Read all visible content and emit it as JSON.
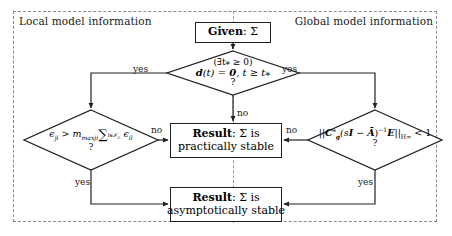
{
  "figure": {
    "type": "flowchart"
  },
  "regions": {
    "left_label": "Local model information",
    "right_label": "Global model information"
  },
  "nodes": {
    "given": {
      "kind": "terminal-box",
      "label_bold": "Given",
      "label_rest": ": Σ"
    },
    "decision_top": {
      "kind": "decision-diamond",
      "line1": "(∃t⁎ ≥ 0)",
      "line2_a": "d",
      "line2_b": "(t) = ",
      "line2_c": "0",
      "line2_d": ",   t ≥ t⁎",
      "question": "?"
    },
    "decision_left": {
      "kind": "decision-diamond",
      "eps_lhs": "ϵ",
      "eps_lhs_sub": "ji",
      "rel": " > ",
      "m_sym": "m",
      "m_sub": "maxji",
      "sum_sym": "∑",
      "sum_sub": "l∈𝒫",
      "sum_sub2": "Ci",
      "eps_rhs": "ϵ",
      "eps_rhs_sub": "il",
      "question": "?"
    },
    "decision_right": {
      "kind": "decision-diamond",
      "norm_open": "||",
      "c_sym": "C",
      "c_sup": "⁎",
      "c_sub": "g",
      "paren": "(s",
      "i_sym": "I",
      "minus": " − ",
      "a_sym": "Ā",
      "close_pow": ")",
      "exp": "−1",
      "e_sym": "E",
      "norm_close": "||",
      "norm_sub": "H",
      "norm_sub2": "∞",
      "compare": " < 1",
      "question": "?"
    },
    "result_practical": {
      "kind": "result-box",
      "line1_bold": "Result",
      "line1_rest": ": Σ is",
      "line2": "practically stable"
    },
    "result_asymptotic": {
      "kind": "result-box",
      "line1_bold": "Result",
      "line1_rest": ": Σ is",
      "line2": "asymptotically stable"
    }
  },
  "edges": {
    "yes_left": "yes",
    "yes_right": "yes",
    "no_top": "no",
    "no_left": "no",
    "no_right": "no",
    "yes_left_bottom": "yes",
    "yes_right_bottom": "yes"
  },
  "colors": {
    "stroke": "#222222",
    "frame_dashed": "#8a8a8a",
    "text": "#000000",
    "background": "#ffffff"
  }
}
